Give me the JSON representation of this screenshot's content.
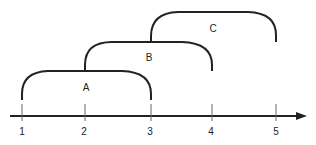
{
  "diagram": {
    "type": "overlapping-intervals-on-number-line",
    "axis": {
      "ticks": [
        {
          "label": "1",
          "x": 22
        },
        {
          "label": "2",
          "x": 85
        },
        {
          "label": "3",
          "x": 151
        },
        {
          "label": "4",
          "x": 212
        },
        {
          "label": "5",
          "x": 276
        }
      ]
    },
    "intervals": [
      {
        "label": "A",
        "start": "1",
        "end": "3"
      },
      {
        "label": "B",
        "start": "2",
        "end": "4"
      },
      {
        "label": "C",
        "start": "3",
        "end": "5"
      }
    ],
    "colors": {
      "stroke": "#222222",
      "background": "#ffffff"
    }
  }
}
